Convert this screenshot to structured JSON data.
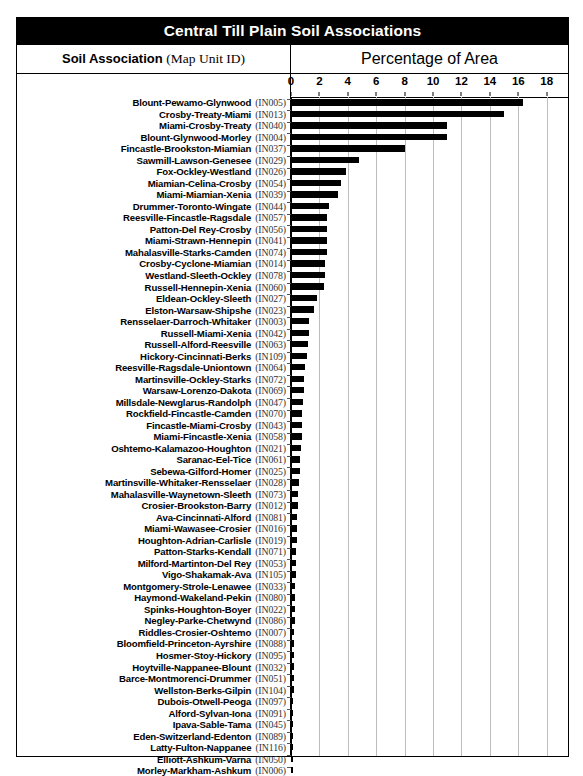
{
  "title": "Central Till Plain Soil Associations",
  "columns": {
    "left_label": "Soil Association",
    "left_sublabel": "(Map Unit ID)",
    "right_label": "Percentage of Area"
  },
  "colors": {
    "bar": "#000000",
    "grid": "#bdbdbd",
    "title_bg": "#000000",
    "title_fg": "#ffffff"
  },
  "chart_data": {
    "type": "bar",
    "orientation": "horizontal",
    "title": "Central Till Plain Soil Associations",
    "xlabel": "Percentage of Area",
    "ylabel": "Soil Association (Map Unit ID)",
    "xlim": [
      0,
      19.5
    ],
    "xticks": [
      0,
      2,
      4,
      6,
      8,
      10,
      12,
      14,
      16,
      18
    ],
    "grid": true,
    "legend": null,
    "categories": [
      "Blount-Pewamo-Glynwood",
      "Crosby-Treaty-Miami",
      "Miami-Crosby-Treaty",
      "Blount-Glynwood-Morley",
      "Fincastle-Brookston-Miamian",
      "Sawmill-Lawson-Genesee",
      "Fox-Ockley-Westland",
      "Miamian-Celina-Crosby",
      "Miami-Miamian-Xenia",
      "Drummer-Toronto-Wingate",
      "Reesville-Fincastle-Ragsdale",
      "Patton-Del Rey-Crosby",
      "Miami-Strawn-Hennepin",
      "Mahalasville-Starks-Camden",
      "Crosby-Cyclone-Miamian",
      "Westland-Sleeth-Ockley",
      "Russell-Hennepin-Xenia",
      "Eldean-Ockley-Sleeth",
      "Elston-Warsaw-Shipshe",
      "Rensselaer-Darroch-Whitaker",
      "Russell-Miami-Xenia",
      "Russell-Alford-Reesville",
      "Hickory-Cincinnati-Berks",
      "Reesville-Ragsdale-Uniontown",
      "Martinsville-Ockley-Starks",
      "Warsaw-Lorenzo-Dakota",
      "Millsdale-Newglarus-Randolph",
      "Rockfield-Fincastle-Camden",
      "Fincastle-Miami-Crosby",
      "Miami-Fincastle-Xenia",
      "Oshtemo-Kalamazoo-Houghton",
      "Saranac-Eel-Tice",
      "Sebewa-Gilford-Homer",
      "Martinsville-Whitaker-Rensselaer",
      "Mahalasville-Waynetown-Sleeth",
      "Crosier-Brookston-Barry",
      "Ava-Cincinnati-Alford",
      "Miami-Wawasee-Crosier",
      "Houghton-Adrian-Carlisle",
      "Patton-Starks-Kendall",
      "Milford-Martinton-Del Rey",
      "Vigo-Shakamak-Ava",
      "Montgomery-Strole-Lenawee",
      "Haymond-Wakeland-Pekin",
      "Spinks-Houghton-Boyer",
      "Negley-Parke-Chetwynd",
      "Riddles-Crosier-Oshtemo",
      "Bloomfield-Princeton-Ayrshire",
      "Hosmer-Stoy-Hickory",
      "Hoytville-Nappanee-Blount",
      "Barce-Montmorenci-Drummer",
      "Wellston-Berks-Gilpin",
      "Dubois-Otwell-Peoga",
      "Alford-Sylvan-Iona",
      "Ipava-Sable-Tama",
      "Eden-Switzerland-Edenton",
      "Latty-Fulton-Nappanee",
      "Elliott-Ashkum-Varna",
      "Morley-Markham-Ashkum"
    ],
    "map_unit_ids": [
      "(IN005)",
      "(IN013)",
      "(IN040)",
      "(IN004)",
      "(IN037)",
      "(IN029)",
      "(IN026)",
      "(IN054)",
      "(IN039)",
      "(IN044)",
      "(IN057)",
      "(IN056)",
      "(IN041)",
      "(IN074)",
      "(IN014)",
      "(IN078)",
      "(IN060)",
      "(IN027)",
      "(IN023)",
      "(IN003)",
      "(IN042)",
      "(IN063)",
      "(IN109)",
      "(IN064)",
      "(IN072)",
      "(IN069)",
      "(IN047)",
      "(IN070)",
      "(IN043)",
      "(IN058)",
      "(IN021)",
      "(IN061)",
      "(IN025)",
      "(IN028)",
      "(IN073)",
      "(IN012)",
      "(IN081)",
      "(IN016)",
      "(IN019)",
      "(IN071)",
      "(IN053)",
      "(IN105)",
      "(IN033)",
      "(IN080)",
      "(IN022)",
      "(IN086)",
      "(IN007)",
      "(IN088)",
      "(IN095)",
      "(IN032)",
      "(IN051)",
      "(IN104)",
      "(IN097)",
      "(IN091)",
      "(IN045)",
      "(IN089)",
      "(IN116)",
      "(IN050)",
      "(IN006)"
    ],
    "values": [
      16.3,
      15.0,
      11.0,
      11.0,
      8.0,
      4.8,
      3.9,
      3.5,
      3.3,
      2.7,
      2.5,
      2.5,
      2.5,
      2.5,
      2.4,
      2.4,
      2.3,
      1.8,
      1.6,
      1.3,
      1.3,
      1.2,
      1.1,
      1.0,
      0.95,
      0.9,
      0.85,
      0.8,
      0.8,
      0.75,
      0.7,
      0.65,
      0.6,
      0.55,
      0.5,
      0.48,
      0.45,
      0.42,
      0.4,
      0.38,
      0.35,
      0.32,
      0.3,
      0.28,
      0.26,
      0.25,
      0.24,
      0.22,
      0.21,
      0.2,
      0.19,
      0.18,
      0.17,
      0.16,
      0.15,
      0.14,
      0.13,
      0.12,
      0.11
    ]
  }
}
